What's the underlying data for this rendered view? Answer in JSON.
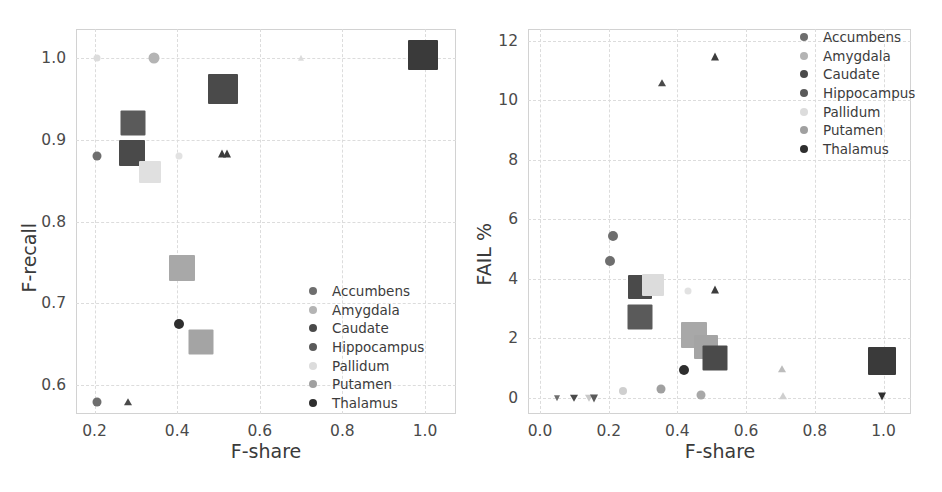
{
  "figure": {
    "width": 942,
    "height": 492,
    "background": "#ffffff",
    "panel_count": 2
  },
  "palette": {
    "accumbens": "#6e6e6e",
    "amygdala": "#b4b4b4",
    "caudate": "#4a4a4a",
    "hippocampus": "#5a5a5a",
    "pallidum": "#dcdcdc",
    "putamen": "#a0a0a0",
    "thalamus": "#2e2e2e",
    "gridline": "#dcdcdc",
    "frame": "#d2d2d2",
    "text": "#3c3c3c"
  },
  "legend": {
    "position": "lower-right (left panel), upper-right (right panel)",
    "entries": [
      {
        "label": "Accumbens",
        "color": "#6e6e6e"
      },
      {
        "label": "Amygdala",
        "color": "#b4b4b4"
      },
      {
        "label": "Caudate",
        "color": "#4a4a4a"
      },
      {
        "label": "Hippocampus",
        "color": "#5a5a5a"
      },
      {
        "label": "Pallidum",
        "color": "#dcdcdc"
      },
      {
        "label": "Putamen",
        "color": "#a0a0a0"
      },
      {
        "label": "Thalamus",
        "color": "#2e2e2e"
      }
    ]
  },
  "chart_data": [
    {
      "type": "scatter",
      "panel": "left",
      "title": "",
      "xlabel": "F-share",
      "ylabel": "F-recall",
      "xlim": [
        0.155,
        1.075
      ],
      "ylim": [
        0.565,
        1.035
      ],
      "xticks": [
        0.2,
        0.4,
        0.6,
        0.8,
        1.0
      ],
      "xtick_labels": [
        "0.2",
        "0.4",
        "0.6",
        "0.8",
        "1.0"
      ],
      "yticks": [
        0.6,
        0.7,
        0.8,
        0.9,
        1.0
      ],
      "ytick_labels": [
        "0.6",
        "0.7",
        "0.8",
        "0.9",
        "1.0"
      ],
      "grid": true,
      "grid_style": "dashed",
      "legend_position": "lower right",
      "marker_note": "marker size encodes structure volume; shape encodes run variant (square / circle / triangle)",
      "points": [
        {
          "structure": "Pallidum",
          "x": 0.205,
          "y": 1.0,
          "size": 7,
          "shape": "circle",
          "color": "#dcdcdc"
        },
        {
          "structure": "Amygdala",
          "x": 0.345,
          "y": 1.0,
          "size": 11,
          "shape": "circle",
          "color": "#b4b4b4"
        },
        {
          "structure": "Pallidum",
          "x": 0.7,
          "y": 1.0,
          "size": 7,
          "shape": "triangle",
          "color": "#dcdcdc"
        },
        {
          "structure": "Thalamus",
          "x": 0.995,
          "y": 1.003,
          "size": 30,
          "shape": "square",
          "color": "#3a3a3a"
        },
        {
          "structure": "Caudate",
          "x": 0.51,
          "y": 0.962,
          "size": 30,
          "shape": "square",
          "color": "#4a4a4a"
        },
        {
          "structure": "Hippocampus",
          "x": 0.292,
          "y": 0.92,
          "size": 25,
          "shape": "square",
          "color": "#5a5a5a"
        },
        {
          "structure": "Accumbens",
          "x": 0.205,
          "y": 0.88,
          "size": 9,
          "shape": "circle",
          "color": "#6e6e6e"
        },
        {
          "structure": "Caudate",
          "x": 0.29,
          "y": 0.884,
          "size": 26,
          "shape": "square",
          "color": "#4a4a4a"
        },
        {
          "structure": "Pallidum",
          "x": 0.333,
          "y": 0.861,
          "size": 22,
          "shape": "square",
          "color": "#e0e0e0"
        },
        {
          "structure": "Pallidum",
          "x": 0.405,
          "y": 0.88,
          "size": 7,
          "shape": "circle",
          "color": "#e2e2e2"
        },
        {
          "structure": "Thalamus",
          "x": 0.508,
          "y": 0.882,
          "size": 9,
          "shape": "triangle",
          "color": "#3c3c3c"
        },
        {
          "structure": "Thalamus",
          "x": 0.52,
          "y": 0.882,
          "size": 9,
          "shape": "triangle",
          "color": "#3c3c3c"
        },
        {
          "structure": "Putamen",
          "x": 0.412,
          "y": 0.743,
          "size": 26,
          "shape": "square",
          "color": "#a8a8a8"
        },
        {
          "structure": "Thalamus",
          "x": 0.404,
          "y": 0.675,
          "size": 10,
          "shape": "circle",
          "color": "#2e2e2e"
        },
        {
          "structure": "Putamen",
          "x": 0.458,
          "y": 0.653,
          "size": 25,
          "shape": "square",
          "color": "#a4a4a4"
        },
        {
          "structure": "Accumbens",
          "x": 0.207,
          "y": 0.58,
          "size": 9,
          "shape": "circle",
          "color": "#6e6e6e"
        },
        {
          "structure": "Caudate",
          "x": 0.28,
          "y": 0.58,
          "size": 8,
          "shape": "triangle",
          "color": "#4a4a4a"
        }
      ]
    },
    {
      "type": "scatter",
      "panel": "right",
      "title": "",
      "xlabel": "F-share",
      "ylabel": "FAIL %",
      "xlim": [
        -0.035,
        1.08
      ],
      "ylim": [
        -0.55,
        12.4
      ],
      "xticks": [
        0.0,
        0.2,
        0.4,
        0.6,
        0.8,
        1.0
      ],
      "xtick_labels": [
        "0.0",
        "0.2",
        "0.4",
        "0.6",
        "0.8",
        "1.0"
      ],
      "yticks": [
        0,
        2,
        4,
        6,
        8,
        10,
        12
      ],
      "ytick_labels": [
        "0",
        "2",
        "4",
        "6",
        "8",
        "10",
        "12"
      ],
      "grid": true,
      "grid_style": "dashed",
      "legend_position": "upper right",
      "marker_note": "marker size encodes structure volume; shape encodes run variant (square / circle / triangle / down-triangle)",
      "points": [
        {
          "structure": "Thalamus",
          "x": 0.51,
          "y": 11.45,
          "size": 9,
          "shape": "triangle",
          "color": "#3c3c3c"
        },
        {
          "structure": "Caudate",
          "x": 0.355,
          "y": 10.6,
          "size": 8,
          "shape": "triangle",
          "color": "#4a4a4a"
        },
        {
          "structure": "Accumbens",
          "x": 0.212,
          "y": 5.45,
          "size": 10,
          "shape": "circle",
          "color": "#6e6e6e"
        },
        {
          "structure": "Accumbens",
          "x": 0.203,
          "y": 4.6,
          "size": 10,
          "shape": "circle",
          "color": "#6e6e6e"
        },
        {
          "structure": "Caudate",
          "x": 0.292,
          "y": 3.72,
          "size": 24,
          "shape": "square",
          "color": "#4a4a4a"
        },
        {
          "structure": "Pallidum",
          "x": 0.33,
          "y": 3.8,
          "size": 22,
          "shape": "square",
          "color": "#dcdcdc"
        },
        {
          "structure": "Thalamus",
          "x": 0.51,
          "y": 3.62,
          "size": 9,
          "shape": "triangle",
          "color": "#3c3c3c"
        },
        {
          "structure": "Pallidum",
          "x": 0.432,
          "y": 3.58,
          "size": 7,
          "shape": "circle",
          "color": "#e2e2e2"
        },
        {
          "structure": "Hippocampus",
          "x": 0.292,
          "y": 2.7,
          "size": 25,
          "shape": "square",
          "color": "#5a5a5a"
        },
        {
          "structure": "Putamen",
          "x": 0.448,
          "y": 2.12,
          "size": 26,
          "shape": "square",
          "color": "#a8a8a8"
        },
        {
          "structure": "Putamen",
          "x": 0.483,
          "y": 1.72,
          "size": 24,
          "shape": "square",
          "color": "#a4a4a4"
        },
        {
          "structure": "Thalamus",
          "x": 0.997,
          "y": 1.22,
          "size": 28,
          "shape": "square",
          "color": "#3a3a3a"
        },
        {
          "structure": "Caudate",
          "x": 0.508,
          "y": 1.32,
          "size": 25,
          "shape": "square",
          "color": "#4a4a4a"
        },
        {
          "structure": "Thalamus",
          "x": 0.418,
          "y": 0.92,
          "size": 10,
          "shape": "circle",
          "color": "#2e2e2e"
        },
        {
          "structure": "Putamen",
          "x": 0.705,
          "y": 0.95,
          "size": 8,
          "shape": "triangle",
          "color": "#bcbcbc"
        },
        {
          "structure": "Putamen",
          "x": 0.352,
          "y": 0.28,
          "size": 9,
          "shape": "circle",
          "color": "#a0a0a0"
        },
        {
          "structure": "Amygdala",
          "x": 0.243,
          "y": 0.22,
          "size": 8,
          "shape": "circle",
          "color": "#cfcfcf"
        },
        {
          "structure": "Putamen",
          "x": 0.47,
          "y": 0.08,
          "size": 9,
          "shape": "circle",
          "color": "#a8a8a8"
        },
        {
          "structure": "Amygdala",
          "x": 0.708,
          "y": 0.05,
          "size": 8,
          "shape": "triangle",
          "color": "#cfcfcf"
        },
        {
          "structure": "Accumbens",
          "x": 0.05,
          "y": 0.0,
          "size": 7,
          "shape": "down-triangle",
          "color": "#6e6e6e"
        },
        {
          "structure": "Caudate",
          "x": 0.1,
          "y": 0.0,
          "size": 8,
          "shape": "down-triangle",
          "color": "#4a4a4a"
        },
        {
          "structure": "Pallidum",
          "x": 0.143,
          "y": 0.0,
          "size": 8,
          "shape": "down-triangle",
          "color": "#c8c8c8"
        },
        {
          "structure": "Hippocampus",
          "x": 0.158,
          "y": 0.0,
          "size": 9,
          "shape": "down-triangle",
          "color": "#5a5a5a"
        },
        {
          "structure": "Thalamus",
          "x": 0.997,
          "y": 0.05,
          "size": 9,
          "shape": "down-triangle",
          "color": "#2e2e2e"
        }
      ]
    }
  ]
}
